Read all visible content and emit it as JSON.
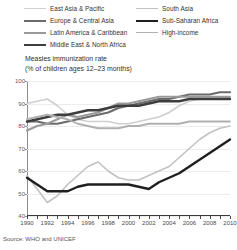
{
  "legend": {
    "items": [
      {
        "label": "East Asia & Pacific",
        "color": "#cfcfcf",
        "width": 1.6,
        "col": 0,
        "row": 0
      },
      {
        "label": "Europe & Central Asia",
        "color": "#6b6b6b",
        "width": 2.2,
        "col": 0,
        "row": 1
      },
      {
        "label": "Latin America & Caribbean",
        "color": "#9a9a9a",
        "width": 2.0,
        "col": 0,
        "row": 2
      },
      {
        "label": "Middle East & North Africa",
        "color": "#3d3d3d",
        "width": 2.4,
        "col": 0,
        "row": 3
      },
      {
        "label": "South Asia",
        "color": "#c2c2c2",
        "width": 1.6,
        "col": 1,
        "row": 0
      },
      {
        "label": "Sub-Saharan Africa",
        "color": "#1f1f1f",
        "width": 2.4,
        "col": 1,
        "row": 1
      },
      {
        "label": "High-income",
        "color": "#b0b0b0",
        "width": 1.8,
        "col": 1,
        "row": 2
      }
    ]
  },
  "title": {
    "line1": "Measles immunization rate",
    "line2": "(% of children ages 12–23 months)"
  },
  "source": {
    "text": "Source: WHO and UNICEF"
  },
  "chart_data": {
    "type": "line",
    "title": "Measles immunization rate (% of children ages 12–23 months)",
    "xlabel": "",
    "ylabel": "% of children ages 12–23 months",
    "xlim": [
      1990,
      2010
    ],
    "ylim": [
      40,
      100
    ],
    "yticks": [
      40,
      50,
      60,
      70,
      80,
      90,
      100
    ],
    "xticks": [
      1990,
      1991,
      1992,
      1993,
      1994,
      1995,
      1996,
      1997,
      1998,
      1999,
      2000,
      2001,
      2002,
      2003,
      2004,
      2005,
      2006,
      2007,
      2008,
      2009,
      2010
    ],
    "xtick_labels": [
      "1990",
      "1992",
      "1994",
      "1996",
      "1998",
      "2000",
      "2002",
      "2004",
      "2006",
      "2008",
      "2010"
    ],
    "xtick_labels_years": [
      1990,
      1992,
      1994,
      1996,
      1998,
      2000,
      2002,
      2004,
      2006,
      2008,
      2010
    ],
    "grid": true,
    "legend_position": "above-plot",
    "x": [
      1990,
      1991,
      1992,
      1993,
      1994,
      1995,
      1996,
      1997,
      1998,
      1999,
      2000,
      2001,
      2002,
      2003,
      2004,
      2005,
      2006,
      2007,
      2008,
      2009,
      2010
    ],
    "series": [
      {
        "name": "East Asia & Pacific",
        "color": "#cfcfcf",
        "width": 1.6,
        "values": [
          90,
          91,
          92,
          89,
          85,
          83,
          82,
          82,
          82,
          81,
          81,
          82,
          83,
          84,
          86,
          89,
          91,
          92,
          92,
          92,
          93
        ]
      },
      {
        "name": "Europe & Central Asia",
        "color": "#6b6b6b",
        "width": 2.2,
        "values": [
          82,
          82,
          81,
          81,
          82,
          83,
          84,
          85,
          86,
          88,
          89,
          90,
          91,
          92,
          92,
          93,
          94,
          94,
          94,
          95,
          95
        ]
      },
      {
        "name": "Latin America & Caribbean",
        "color": "#9a9a9a",
        "width": 2.0,
        "values": [
          78,
          80,
          81,
          83,
          85,
          84,
          85,
          86,
          88,
          90,
          90,
          91,
          92,
          93,
          93,
          93,
          93,
          93,
          93,
          93,
          93
        ]
      },
      {
        "name": "Middle East & North Africa",
        "color": "#3d3d3d",
        "width": 2.4,
        "values": [
          82,
          83,
          84,
          85,
          85,
          86,
          87,
          87,
          88,
          89,
          89,
          89,
          90,
          91,
          91,
          91,
          92,
          92,
          92,
          92,
          92
        ]
      },
      {
        "name": "South Asia",
        "color": "#c2c2c2",
        "width": 1.6,
        "values": [
          58,
          52,
          46,
          49,
          54,
          58,
          62,
          64,
          60,
          57,
          56,
          56,
          58,
          60,
          62,
          66,
          70,
          74,
          77,
          79,
          80
        ]
      },
      {
        "name": "Sub-Saharan Africa",
        "color": "#1f1f1f",
        "width": 2.4,
        "values": [
          57,
          54,
          51,
          51,
          51,
          53,
          54,
          54,
          54,
          54,
          54,
          53,
          52,
          55,
          57,
          59,
          62,
          65,
          68,
          71,
          74
        ]
      },
      {
        "name": "High-income",
        "color": "#b0b0b0",
        "width": 1.8,
        "values": [
          83,
          84,
          85,
          84,
          83,
          81,
          80,
          79,
          79,
          79,
          80,
          80,
          81,
          81,
          81,
          81,
          82,
          82,
          82,
          82,
          82
        ]
      }
    ]
  }
}
